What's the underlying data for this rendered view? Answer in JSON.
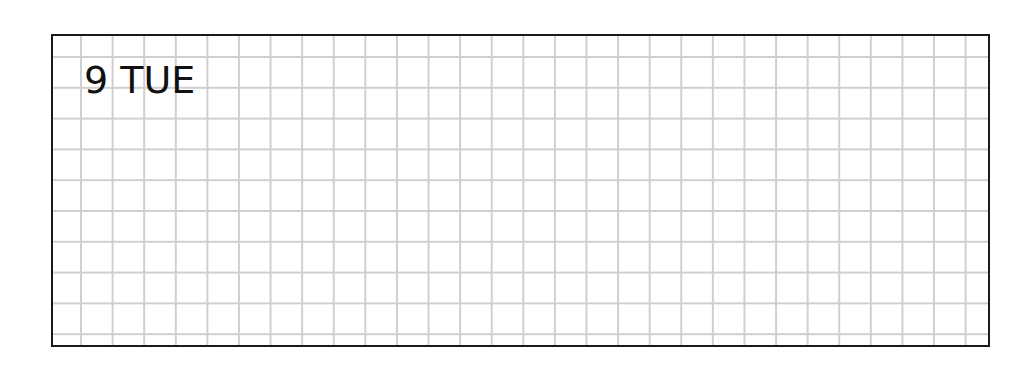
{
  "planner": {
    "date_label": "9 TUE",
    "day_number": "9",
    "weekday": "TUE",
    "border_color": "#1a1a1a",
    "grid_color": "#cfcfcf"
  }
}
